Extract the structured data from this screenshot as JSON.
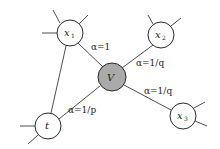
{
  "diagram": {
    "type": "graph",
    "colors": {
      "center_fill": "#aaaaaa",
      "node_fill": "#ffffff",
      "stroke": "#2a2a2a"
    },
    "nodes": [
      {
        "id": "x1",
        "label": "x",
        "sub": "1",
        "cx": 70,
        "cy": 33,
        "r": 13,
        "fill": "#ffffff"
      },
      {
        "id": "x2",
        "label": "x",
        "sub": "2",
        "cx": 161,
        "cy": 35,
        "r": 13,
        "fill": "#ffffff"
      },
      {
        "id": "V",
        "label": "V",
        "sub": "",
        "cx": 112,
        "cy": 77,
        "r": 14,
        "fill": "#aaaaaa"
      },
      {
        "id": "t",
        "label": "t",
        "sub": "",
        "cx": 48,
        "cy": 126,
        "r": 13,
        "fill": "#ffffff"
      },
      {
        "id": "x3",
        "label": "x",
        "sub": "3",
        "cx": 183,
        "cy": 116,
        "r": 13,
        "fill": "#ffffff"
      }
    ],
    "edges": [
      {
        "from": "x1",
        "to": "V",
        "label": "α=1"
      },
      {
        "from": "x2",
        "to": "V",
        "label": "α=1/q"
      },
      {
        "from": "t",
        "to": "V",
        "label": "α=1/p"
      },
      {
        "from": "x3",
        "to": "V",
        "label": "α=1/q"
      },
      {
        "from": "x1",
        "to": "t",
        "label": ""
      }
    ],
    "edge_labels": {
      "x1_V": "α=1",
      "x2_V": "α=1/q",
      "t_V": "α=1/p",
      "x3_V": "α=1/q"
    },
    "node_labels": {
      "x1": "x",
      "x1_sub": "1",
      "x2": "x",
      "x2_sub": "2",
      "V": "V",
      "t": "t",
      "x3": "x",
      "x3_sub": "3"
    }
  }
}
